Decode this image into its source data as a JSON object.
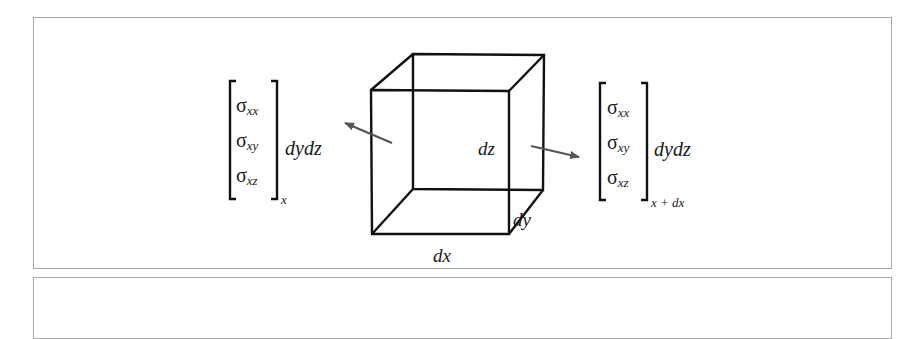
{
  "figure": {
    "type": "stress-element-diagram",
    "element": {
      "edge_labels": {
        "height": "dz",
        "depth": "dy",
        "width": "dx"
      }
    },
    "left_vector": {
      "components": [
        {
          "symbol": "σ",
          "subscript": "xx"
        },
        {
          "symbol": "σ",
          "subscript": "xy"
        },
        {
          "symbol": "σ",
          "subscript": "xz"
        }
      ],
      "evaluated_at": "x",
      "area_factor": "dydz"
    },
    "right_vector": {
      "components": [
        {
          "symbol": "σ",
          "subscript": "xx"
        },
        {
          "symbol": "σ",
          "subscript": "xy"
        },
        {
          "symbol": "σ",
          "subscript": "xz"
        }
      ],
      "evaluated_at": "x + dx",
      "area_factor": "dydz"
    },
    "colors": {
      "edge": "#111111",
      "arrow": "#555555",
      "frame": "#a8a8a8"
    }
  }
}
